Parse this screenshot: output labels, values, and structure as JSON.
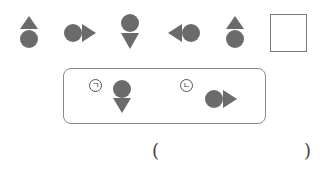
{
  "colors": {
    "shape_fill": "#6b6b6b",
    "box_border": "#7a7a7a",
    "text": "#333333"
  },
  "sequence": {
    "items": [
      {
        "index": 1,
        "shape": "triangle-up-over-circle"
      },
      {
        "index": 2,
        "shape": "circle-with-triangle-right"
      },
      {
        "index": 3,
        "shape": "circle-over-triangle-down"
      },
      {
        "index": 4,
        "shape": "triangle-left-with-circle"
      },
      {
        "index": 5,
        "shape": "triangle-up-over-circle"
      },
      {
        "index": 6,
        "shape": "empty-answer-box"
      }
    ]
  },
  "choices": [
    {
      "label": "ㄱ",
      "shape": "circle-over-triangle-down"
    },
    {
      "label": "ㄴ",
      "shape": "circle-with-triangle-right"
    }
  ],
  "answer": {
    "open_paren": "(",
    "close_paren": ")",
    "value": ""
  }
}
